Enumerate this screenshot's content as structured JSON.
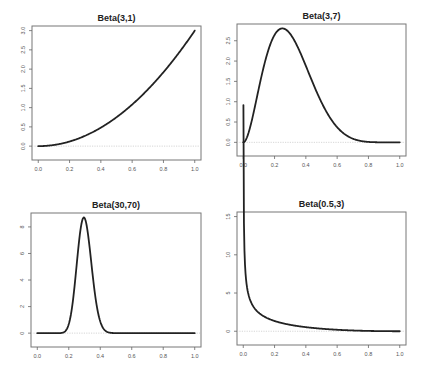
{
  "chart_data": [
    {
      "type": "line",
      "title": "Beta(3,1)",
      "distribution": {
        "alpha": 3,
        "beta": 1
      },
      "xlabel": "",
      "ylabel": "",
      "xlim": [
        0,
        1
      ],
      "ylim": [
        0,
        3
      ],
      "xticks": [
        "0.0",
        "0.2",
        "0.4",
        "0.6",
        "0.8",
        "1.0"
      ],
      "yticks": [
        "0.0",
        "0.5",
        "1.0",
        "1.5",
        "2.0",
        "2.5",
        "3.0"
      ],
      "reference_line_y": 0,
      "grid": false,
      "position": "top-left",
      "series": [
        {
          "name": "density",
          "x": [
            0,
            0.1,
            0.2,
            0.3,
            0.4,
            0.5,
            0.6,
            0.7,
            0.8,
            0.9,
            1.0
          ],
          "y": [
            0,
            0.03,
            0.12,
            0.27,
            0.48,
            0.75,
            1.08,
            1.47,
            1.92,
            2.43,
            3.0
          ]
        }
      ]
    },
    {
      "type": "line",
      "title": "Beta(3,7)",
      "distribution": {
        "alpha": 3,
        "beta": 7
      },
      "xlabel": "",
      "ylabel": "",
      "xlim": [
        0,
        1
      ],
      "ylim": [
        0,
        2.8
      ],
      "xticks": [
        "0.0",
        "0.2",
        "0.4",
        "0.6",
        "0.8",
        "1.0"
      ],
      "yticks": [
        "0.0",
        "0.5",
        "1.0",
        "1.5",
        "2.0",
        "2.5",
        "3.0"
      ],
      "reference_line_y": 0,
      "grid": false,
      "position": "top-right",
      "series": [
        {
          "name": "density",
          "x": [
            0,
            0.1,
            0.2,
            0.25,
            0.3,
            0.4,
            0.5,
            0.6,
            0.7,
            0.8,
            0.9,
            1.0
          ],
          "y": [
            0,
            1.72,
            2.68,
            2.82,
            2.67,
            1.69,
            0.7,
            0.18,
            0.02,
            0.0,
            0.0,
            0
          ]
        }
      ]
    },
    {
      "type": "line",
      "title": "Beta(30,70)",
      "distribution": {
        "alpha": 30,
        "beta": 70
      },
      "xlabel": "",
      "ylabel": "",
      "xlim": [
        0,
        1
      ],
      "ylim": [
        0,
        8.7
      ],
      "xticks": [
        "0.0",
        "0.2",
        "0.4",
        "0.6",
        "0.8",
        "1.0"
      ],
      "yticks": [
        "0",
        "2",
        "4",
        "6",
        "8"
      ],
      "reference_line_y": 0,
      "grid": false,
      "position": "bottom-left",
      "series": [
        {
          "name": "density",
          "x": [
            0,
            0.15,
            0.2,
            0.25,
            0.3,
            0.35,
            0.4,
            0.45,
            1.0
          ],
          "y": [
            0,
            0.01,
            0.9,
            5.5,
            8.7,
            5.3,
            1.1,
            0.08,
            0
          ]
        }
      ]
    },
    {
      "type": "line",
      "title": "Beta(0.5,3)",
      "distribution": {
        "alpha": 0.5,
        "beta": 3
      },
      "xlabel": "",
      "ylabel": "",
      "xlim": [
        0,
        1
      ],
      "ylim": [
        0,
        15
      ],
      "xticks": [
        "0.0",
        "0.2",
        "0.4",
        "0.6",
        "0.8",
        "1.0"
      ],
      "yticks": [
        "0",
        "5",
        "10",
        "15"
      ],
      "reference_line_y": 0,
      "grid": false,
      "position": "bottom-right",
      "series": [
        {
          "name": "density",
          "x": [
            0.001,
            0.01,
            0.05,
            0.1,
            0.2,
            0.4,
            0.6,
            0.8,
            1.0
          ],
          "y": [
            15,
            4.7,
            1.9,
            1.2,
            0.67,
            0.23,
            0.07,
            0.01,
            0
          ]
        }
      ]
    }
  ]
}
